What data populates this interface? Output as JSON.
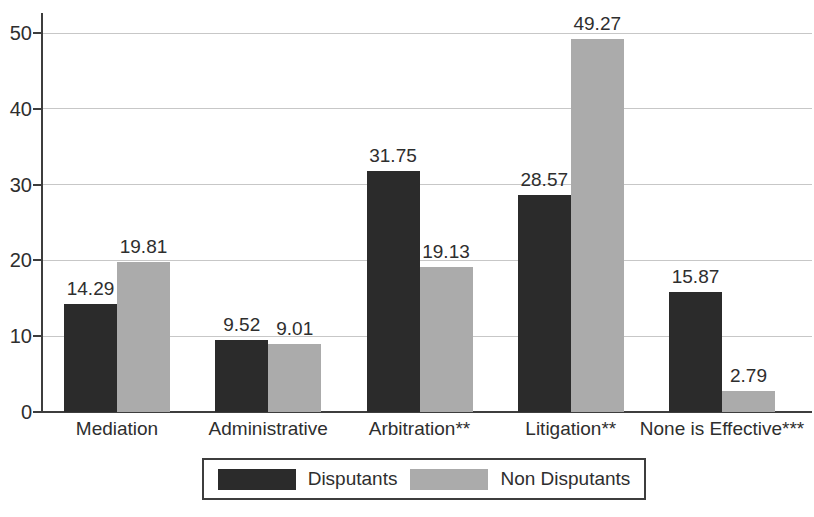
{
  "chart_data": {
    "type": "bar",
    "title": "",
    "xlabel": "",
    "ylabel": "",
    "categories": [
      "Mediation",
      "Administrative",
      "Arbitration**",
      "Litigation**",
      "None is Effective***"
    ],
    "series": [
      {
        "name": "Disputants",
        "color": "#2b2b2b",
        "values": [
          14.29,
          9.52,
          31.75,
          28.57,
          15.87
        ]
      },
      {
        "name": "Non Disputants",
        "color": "#ababab",
        "values": [
          19.81,
          9.01,
          19.13,
          49.27,
          2.79
        ]
      }
    ],
    "value_labels": [
      "14.29",
      "19.81",
      "9.52",
      "9.01",
      "31.75",
      "19.13",
      "28.57",
      "49.27",
      "15.87",
      "2.79"
    ],
    "ylim": [
      0,
      50
    ],
    "yticks": [
      "0",
      "10",
      "20",
      "30",
      "40",
      "50"
    ],
    "grid": "horizontal",
    "legend_position": "bottom-center"
  },
  "colors": {
    "axis": "#3d3d3d",
    "gridline": "#c7c7c7",
    "text": "#2e2e2e",
    "background": "#ffffff"
  }
}
